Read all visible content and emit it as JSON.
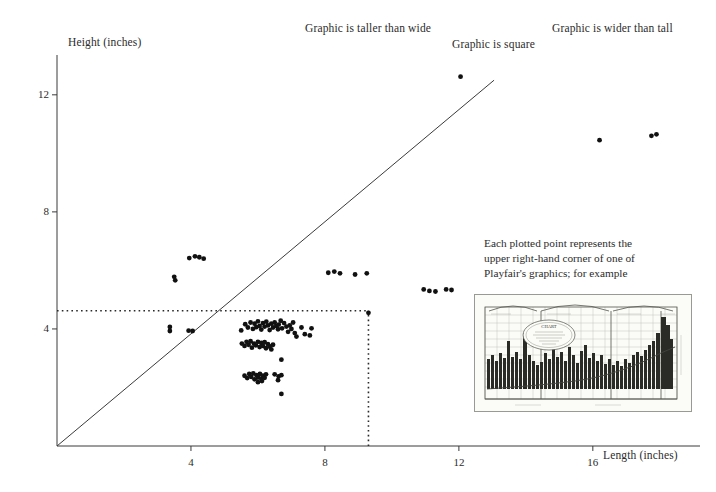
{
  "figure": {
    "domain_note": "scatter plot of Playfair graphic dimensions",
    "background_color": "#ffffff",
    "ink_color": "#1a1a1a"
  },
  "annotations": {
    "taller_than_wide": "Graphic is taller than wide",
    "square": "Graphic is square",
    "wider_than_tall": "Graphic is wider than tall"
  },
  "callout": {
    "line1": "Each plotted point represents the",
    "line2": "upper right-hand corner of one of",
    "line3": "Playfair's graphics; for example"
  },
  "thumbnail": {
    "name": "playfair-chart-thumbnail",
    "cartouche_title": "CHART",
    "description": "engraved Playfair time-series chart with bars and curve"
  },
  "chart_data": {
    "type": "scatter",
    "title": "",
    "xlabel": "Length (inches)",
    "ylabel": "Height (inches)",
    "xlim": [
      0,
      19.2
    ],
    "ylim": [
      0,
      13.6
    ],
    "xticks": [
      4,
      8,
      12,
      16
    ],
    "xticklabels": [
      "4",
      "8",
      "12",
      "16"
    ],
    "yticks": [
      4,
      8,
      12
    ],
    "yticklabels": [
      "4",
      "8",
      "12"
    ],
    "grid": false,
    "legend": "none",
    "reference_lines": [
      {
        "name": "square-diagonal",
        "kind": "line",
        "label": "Graphic is square",
        "from": [
          0,
          0
        ],
        "to": [
          13.05,
          12.5
        ],
        "style": "solid"
      },
      {
        "name": "dotted-height-bound",
        "kind": "horizontal",
        "y": 4.62,
        "x_from": 0,
        "x_to": 9.3,
        "style": "dotted"
      },
      {
        "name": "dotted-length-bound",
        "kind": "vertical",
        "x": 9.3,
        "y_from": 0,
        "y_to": 4.62,
        "style": "dotted"
      }
    ],
    "points": [
      [
        3.37,
        4.07
      ],
      [
        3.37,
        3.93
      ],
      [
        3.95,
        6.42
      ],
      [
        4.12,
        6.48
      ],
      [
        4.25,
        6.45
      ],
      [
        4.38,
        6.4
      ],
      [
        3.5,
        5.78
      ],
      [
        3.53,
        5.66
      ],
      [
        3.93,
        3.94
      ],
      [
        4.05,
        3.93
      ],
      [
        8.1,
        5.92
      ],
      [
        8.28,
        5.96
      ],
      [
        8.45,
        5.9
      ],
      [
        8.9,
        5.86
      ],
      [
        9.25,
        5.9
      ],
      [
        10.95,
        5.35
      ],
      [
        11.12,
        5.3
      ],
      [
        11.3,
        5.28
      ],
      [
        11.62,
        5.35
      ],
      [
        11.78,
        5.33
      ],
      [
        12.05,
        12.62
      ],
      [
        16.2,
        10.45
      ],
      [
        17.75,
        10.6
      ],
      [
        17.9,
        10.65
      ],
      [
        5.5,
        3.95
      ],
      [
        5.62,
        4.16
      ],
      [
        5.7,
        4.05
      ],
      [
        5.78,
        4.22
      ],
      [
        5.85,
        4.0
      ],
      [
        5.9,
        4.18
      ],
      [
        5.95,
        4.06
      ],
      [
        6.0,
        4.26
      ],
      [
        6.05,
        4.1
      ],
      [
        6.1,
        3.98
      ],
      [
        6.15,
        4.2
      ],
      [
        6.2,
        4.08
      ],
      [
        6.25,
        4.25
      ],
      [
        6.3,
        4.12
      ],
      [
        6.35,
        3.96
      ],
      [
        6.4,
        4.18
      ],
      [
        6.45,
        4.05
      ],
      [
        6.5,
        4.22
      ],
      [
        6.55,
        4.1
      ],
      [
        6.6,
        3.99
      ],
      [
        6.62,
        4.15
      ],
      [
        6.68,
        4.28
      ],
      [
        6.72,
        4.02
      ],
      [
        6.78,
        4.2
      ],
      [
        6.85,
        4.08
      ],
      [
        6.9,
        3.9
      ],
      [
        6.95,
        4.12
      ],
      [
        7.0,
        4.0
      ],
      [
        7.05,
        4.22
      ],
      [
        7.1,
        3.86
      ],
      [
        7.3,
        4.05
      ],
      [
        7.4,
        3.82
      ],
      [
        7.55,
        3.78
      ],
      [
        7.6,
        4.02
      ],
      [
        7.15,
        3.74
      ],
      [
        5.52,
        3.5
      ],
      [
        5.6,
        3.42
      ],
      [
        5.66,
        3.56
      ],
      [
        5.72,
        3.46
      ],
      [
        5.78,
        3.58
      ],
      [
        5.82,
        3.36
      ],
      [
        5.88,
        3.5
      ],
      [
        5.94,
        3.44
      ],
      [
        6.0,
        3.56
      ],
      [
        6.05,
        3.38
      ],
      [
        6.1,
        3.52
      ],
      [
        6.15,
        3.42
      ],
      [
        6.2,
        3.55
      ],
      [
        6.24,
        3.34
      ],
      [
        6.3,
        3.48
      ],
      [
        6.35,
        3.4
      ],
      [
        6.4,
        3.3
      ],
      [
        6.45,
        3.46
      ],
      [
        6.7,
        2.95
      ],
      [
        5.6,
        2.4
      ],
      [
        5.68,
        2.32
      ],
      [
        5.74,
        2.46
      ],
      [
        5.8,
        2.36
      ],
      [
        5.86,
        2.48
      ],
      [
        5.9,
        2.28
      ],
      [
        5.96,
        2.42
      ],
      [
        6.0,
        2.34
      ],
      [
        6.06,
        2.46
      ],
      [
        6.1,
        2.3
      ],
      [
        6.15,
        2.4
      ],
      [
        6.2,
        2.33
      ],
      [
        6.24,
        2.45
      ],
      [
        6.0,
        2.18
      ],
      [
        6.12,
        2.22
      ],
      [
        6.5,
        2.45
      ],
      [
        6.62,
        2.38
      ],
      [
        6.6,
        2.25
      ],
      [
        6.7,
        2.42
      ],
      [
        6.7,
        1.78
      ],
      [
        9.3,
        4.55
      ]
    ],
    "marker": {
      "shape": "circle",
      "color": "#111111",
      "size": 2.4
    }
  }
}
